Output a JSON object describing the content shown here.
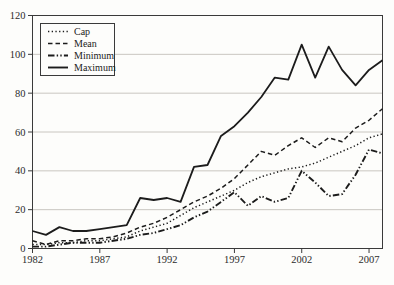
{
  "figure": {
    "background": "#fdfdfb",
    "line_color": "#1c1c1c",
    "grid_color": "#c9c6c0",
    "border_color": "#3a3a3a"
  },
  "chart_data": {
    "type": "line",
    "title": "",
    "xlabel": "",
    "ylabel": "",
    "grid": "horizontal",
    "legend_position": "top-left",
    "x_range": [
      1982,
      2008
    ],
    "ylim": [
      0,
      120
    ],
    "yticks": [
      0,
      20,
      40,
      60,
      80,
      100,
      120
    ],
    "xticks": [
      1982,
      1987,
      1992,
      1997,
      2002,
      2007
    ],
    "x": [
      1982,
      1983,
      1984,
      1985,
      1986,
      1987,
      1988,
      1989,
      1990,
      1991,
      1992,
      1993,
      1994,
      1995,
      1996,
      1997,
      1998,
      1999,
      2000,
      2001,
      2002,
      2003,
      2004,
      2005,
      2006,
      2007,
      2008
    ],
    "series": [
      {
        "name": "Cap",
        "style": "dotted",
        "dash": "1.3 2.4",
        "width": 1.5,
        "values": [
          2,
          2,
          3,
          3,
          4,
          4,
          5,
          6,
          9,
          11,
          13,
          17,
          21,
          24,
          27,
          30,
          34,
          37,
          39,
          41,
          42,
          44,
          47,
          50,
          53,
          57,
          59
        ]
      },
      {
        "name": "Mean",
        "style": "dashed",
        "dash": "4.5 3",
        "width": 1.5,
        "values": [
          4,
          2,
          4,
          4,
          5,
          5,
          6,
          8,
          11,
          13,
          16,
          20,
          24,
          27,
          31,
          36,
          43,
          50,
          48,
          53,
          57,
          52,
          57,
          55,
          62,
          66,
          72
        ]
      },
      {
        "name": "Minimum",
        "style": "dash-dot-dot",
        "dash": "6.5 2.2 1.4 2.2 1.4 2.2",
        "width": 1.9,
        "values": [
          1,
          1,
          2,
          3,
          3,
          3,
          4,
          5,
          7,
          8,
          10,
          12,
          16,
          19,
          24,
          29,
          22,
          27,
          24,
          26,
          40,
          34,
          27,
          28,
          38,
          51,
          49
        ]
      },
      {
        "name": "Maximum",
        "style": "solid",
        "dash": "none",
        "width": 1.8,
        "values": [
          9,
          7,
          11,
          9,
          9,
          10,
          11,
          12,
          26,
          25,
          26,
          24,
          42,
          43,
          58,
          63,
          70,
          78,
          88,
          87,
          105,
          88,
          104,
          92,
          84,
          92,
          97
        ]
      }
    ]
  }
}
